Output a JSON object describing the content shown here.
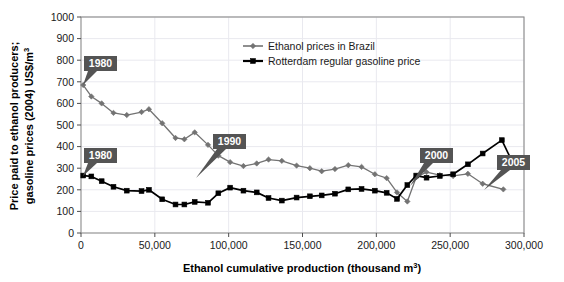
{
  "chart_data": {
    "type": "line",
    "title": "",
    "xlabel": "Ethanol cumulative production (thousand m³)",
    "ylabel": "Price paid to ethanol producers; gasoline prices (2004) US$/m³",
    "ylabel_line1": "Price paid to ethanol producers;",
    "ylabel_line2": "gasoline prices (2004) US$/m",
    "ylabel_line2_sup": "3",
    "xlabel_main": "Ethanol cumulative production (thousand m",
    "xlabel_sup": "3",
    "xlabel_close": ")",
    "xlim": [
      0,
      300000
    ],
    "ylim": [
      0,
      1000
    ],
    "xticks": [
      0,
      50000,
      100000,
      150000,
      200000,
      250000,
      300000
    ],
    "xtick_labels": [
      "0",
      "50,000",
      "100,000",
      "150,000",
      "200,000",
      "250,000",
      "300,000"
    ],
    "yticks": [
      0,
      100,
      200,
      300,
      400,
      500,
      600,
      700,
      800,
      900,
      1000
    ],
    "ytick_labels": [
      "0",
      "100",
      "200",
      "300",
      "400",
      "500",
      "600",
      "700",
      "800",
      "900",
      "1000"
    ],
    "grid": "horizontal-and-vertical-light",
    "legend_position": "top-center-right",
    "series": [
      {
        "name": "Ethanol prices in Brazil",
        "color": "#737373",
        "marker": "diamond",
        "points": [
          [
            1500,
            685
          ],
          [
            7000,
            632
          ],
          [
            14000,
            600
          ],
          [
            22000,
            556
          ],
          [
            31000,
            546
          ],
          [
            41000,
            560
          ],
          [
            46000,
            573
          ],
          [
            55000,
            508
          ],
          [
            64000,
            440
          ],
          [
            70000,
            434
          ],
          [
            77000,
            466
          ],
          [
            86000,
            408
          ],
          [
            93000,
            358
          ],
          [
            101000,
            328
          ],
          [
            110000,
            310
          ],
          [
            119000,
            322
          ],
          [
            127000,
            340
          ],
          [
            136000,
            334
          ],
          [
            146000,
            312
          ],
          [
            155000,
            300
          ],
          [
            163000,
            286
          ],
          [
            172000,
            296
          ],
          [
            181000,
            314
          ],
          [
            190000,
            306
          ],
          [
            199000,
            272
          ],
          [
            207000,
            254
          ],
          [
            214000,
            188
          ],
          [
            221000,
            146
          ],
          [
            227000,
            258
          ],
          [
            234000,
            282
          ],
          [
            243000,
            268
          ],
          [
            252000,
            264
          ],
          [
            262000,
            274
          ],
          [
            272000,
            228
          ],
          [
            286000,
            202
          ]
        ]
      },
      {
        "name": "Rotterdam regular gasoline price",
        "color": "#000000",
        "marker": "square",
        "points": [
          [
            1500,
            266
          ],
          [
            7000,
            262
          ],
          [
            14000,
            240
          ],
          [
            22000,
            214
          ],
          [
            31000,
            196
          ],
          [
            41000,
            194
          ],
          [
            46000,
            200
          ],
          [
            55000,
            156
          ],
          [
            64000,
            132
          ],
          [
            70000,
            132
          ],
          [
            77000,
            144
          ],
          [
            86000,
            140
          ],
          [
            93000,
            184
          ],
          [
            101000,
            210
          ],
          [
            110000,
            196
          ],
          [
            119000,
            188
          ],
          [
            127000,
            162
          ],
          [
            136000,
            150
          ],
          [
            146000,
            164
          ],
          [
            155000,
            170
          ],
          [
            163000,
            174
          ],
          [
            172000,
            182
          ],
          [
            181000,
            202
          ],
          [
            190000,
            204
          ],
          [
            199000,
            196
          ],
          [
            207000,
            186
          ],
          [
            214000,
            158
          ],
          [
            221000,
            222
          ],
          [
            227000,
            266
          ],
          [
            234000,
            256
          ],
          [
            243000,
            264
          ],
          [
            252000,
            272
          ],
          [
            262000,
            318
          ],
          [
            272000,
            368
          ],
          [
            285000,
            430
          ],
          [
            292000,
            330
          ]
        ]
      }
    ],
    "annotations": [
      {
        "label": "1980",
        "box_x": 84,
        "box_y": 56,
        "tail": "down-left",
        "target_x": 83,
        "target_y": 85
      },
      {
        "label": "1980",
        "box_x": 84,
        "box_y": 148,
        "tail": "down-left",
        "target_x": 83,
        "target_y": 176
      },
      {
        "label": "1990",
        "box_x": 213,
        "box_y": 134,
        "tail": "down-left",
        "target_x": 196,
        "target_y": 178
      },
      {
        "label": "2000",
        "box_x": 420,
        "box_y": 148,
        "tail": "down-left",
        "target_x": 410,
        "target_y": 186
      },
      {
        "label": "2005",
        "box_x": 497,
        "box_y": 155,
        "tail": "down-left",
        "target_x": 484,
        "target_y": 190
      }
    ]
  },
  "legend": {
    "items": [
      {
        "label": "Ethanol prices in Brazil",
        "color": "#737373",
        "marker": "diamond"
      },
      {
        "label": "Rotterdam regular gasoline price",
        "color": "#000000",
        "marker": "square"
      }
    ]
  }
}
